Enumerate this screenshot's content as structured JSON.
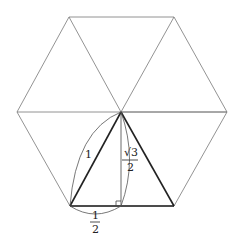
{
  "diagram": {
    "labels": {
      "hypotenuse": "1",
      "height_num": "√3",
      "height_den": "2",
      "base_num": "1",
      "base_den": "2"
    },
    "colors": {
      "thin_lines": "#777777",
      "thick_lines": "#222222",
      "text": "#222222"
    }
  }
}
